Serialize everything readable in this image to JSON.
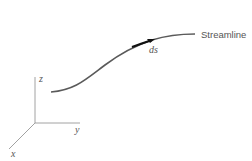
{
  "diagram": {
    "streamline_label": "Streamline",
    "element_label": "ds",
    "axes": {
      "x": "x",
      "y": "y",
      "z": "z"
    },
    "colors": {
      "curve": "#555555",
      "axes": "#888888",
      "arrow": "#111111"
    }
  }
}
